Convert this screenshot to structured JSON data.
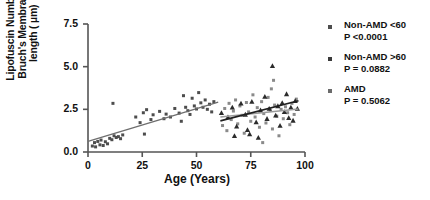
{
  "chart_data": {
    "type": "scatter",
    "title": "",
    "xlabel": "Age (Years)",
    "ylabel_line1": "Lipofuscin Number/",
    "ylabel_line2": "Bruch's Membrane",
    "ylabel_line3": "length ( µm)",
    "xlim": [
      0,
      100
    ],
    "ylim": [
      0.0,
      7.5
    ],
    "xticks": [
      "0",
      "25",
      "50",
      "75",
      "100"
    ],
    "xtick_values": [
      0,
      25,
      50,
      75,
      100
    ],
    "yticks": [
      "0.0",
      "2.5",
      "5.0",
      "7.5"
    ],
    "ytick_values": [
      0.0,
      2.5,
      5.0,
      7.5
    ],
    "grid": false,
    "legend_position": "right",
    "series": [
      {
        "name": "Non-AMD <60",
        "pvalue": "P <0.0001",
        "marker": "square",
        "color": "#4d4d4d",
        "points": [
          [
            2.0,
            0.35
          ],
          [
            3.0,
            0.55
          ],
          [
            3.5,
            0.3
          ],
          [
            4.5,
            0.62
          ],
          [
            5.5,
            0.42
          ],
          [
            6.0,
            0.7
          ],
          [
            7.0,
            0.38
          ],
          [
            8.0,
            0.6
          ],
          [
            9.0,
            0.48
          ],
          [
            10.0,
            0.8
          ],
          [
            11.0,
            0.72
          ],
          [
            12.0,
            0.95
          ],
          [
            13.0,
            0.85
          ],
          [
            14.0,
            0.9
          ],
          [
            15.0,
            0.78
          ],
          [
            16.0,
            1.0
          ],
          [
            11.5,
            2.85
          ],
          [
            22.0,
            2.05
          ],
          [
            24.0,
            1.72
          ],
          [
            25.5,
            2.3
          ],
          [
            26.0,
            1.05
          ],
          [
            27.0,
            2.48
          ],
          [
            29.0,
            1.9
          ],
          [
            30.0,
            2.18
          ],
          [
            33.0,
            2.38
          ],
          [
            35.0,
            1.95
          ],
          [
            36.0,
            2.22
          ],
          [
            38.0,
            2.05
          ],
          [
            40.0,
            2.55
          ],
          [
            42.0,
            2.28
          ],
          [
            43.0,
            1.8
          ],
          [
            44.0,
            3.3
          ],
          [
            45.0,
            2.62
          ],
          [
            46.0,
            2.42
          ],
          [
            47.0,
            2.2
          ],
          [
            48.0,
            3.15
          ],
          [
            49.0,
            2.7
          ],
          [
            50.0,
            2.52
          ],
          [
            51.0,
            3.48
          ],
          [
            52.0,
            2.88
          ],
          [
            53.0,
            2.62
          ],
          [
            54.0,
            3.05
          ],
          [
            55.0,
            2.5
          ],
          [
            56.0,
            2.8
          ],
          [
            57.0,
            2.35
          ],
          [
            58.0,
            2.95
          ]
        ],
        "fit_line": {
          "x0": 0,
          "y0": 0.62,
          "x1": 60,
          "y1": 2.92
        }
      },
      {
        "name": "Non-AMD >60",
        "pvalue": "P = 0.0882",
        "marker": "square",
        "color": "#8a8a8a",
        "points": [
          [
            62.0,
            1.55
          ],
          [
            63.0,
            2.55
          ],
          [
            64.0,
            1.25
          ],
          [
            65.0,
            2.85
          ],
          [
            66.0,
            1.9
          ],
          [
            67.0,
            2.4
          ],
          [
            68.0,
            3.05
          ],
          [
            69.0,
            1.65
          ],
          [
            70.0,
            2.7
          ],
          [
            71.0,
            2.15
          ],
          [
            72.0,
            1.1
          ],
          [
            73.0,
            2.9
          ],
          [
            74.0,
            2.35
          ],
          [
            75.0,
            1.8
          ],
          [
            76.0,
            3.35
          ],
          [
            77.0,
            2.05
          ],
          [
            78.0,
            2.6
          ],
          [
            79.0,
            1.45
          ],
          [
            80.0,
            2.95
          ],
          [
            81.0,
            2.25
          ],
          [
            82.0,
            1.7
          ],
          [
            83.0,
            3.2
          ],
          [
            84.0,
            2.45
          ],
          [
            85.0,
            1.35
          ],
          [
            86.0,
            2.75
          ],
          [
            87.0,
            2.1
          ],
          [
            88.0,
            0.95
          ],
          [
            89.0,
            2.5
          ],
          [
            90.0,
            1.95
          ],
          [
            91.0,
            2.65
          ],
          [
            92.0,
            2.3
          ],
          [
            93.0,
            1.6
          ],
          [
            94.0,
            2.85
          ],
          [
            95.0,
            2.2
          ],
          [
            96.0,
            3.1
          ],
          [
            85.5,
            4.2
          ],
          [
            84.5,
            3.7
          ],
          [
            80.5,
            0.55
          ]
        ],
        "fit_line": {
          "x0": 61,
          "y0": 2.05,
          "x1": 97,
          "y1": 2.52
        }
      },
      {
        "name": "AMD",
        "pvalue": "P =  0.5062",
        "marker": "triangle",
        "color": "#2b2b2b",
        "points": [
          [
            61.5,
            2.3
          ],
          [
            64.5,
            2.05
          ],
          [
            66.5,
            2.62
          ],
          [
            68.5,
            1.5
          ],
          [
            70.5,
            2.85
          ],
          [
            72.5,
            2.2
          ],
          [
            73.5,
            1.3
          ],
          [
            75.5,
            2.95
          ],
          [
            77.5,
            1.75
          ],
          [
            79.5,
            2.45
          ],
          [
            81.5,
            3.25
          ],
          [
            82.5,
            1.95
          ],
          [
            83.5,
            2.55
          ],
          [
            85.0,
            5.05
          ],
          [
            86.5,
            2.15
          ],
          [
            87.5,
            2.7
          ],
          [
            88.5,
            1.55
          ],
          [
            89.5,
            2.88
          ],
          [
            90.5,
            2.35
          ],
          [
            91.5,
            3.4
          ],
          [
            92.5,
            2.0
          ],
          [
            93.5,
            2.62
          ],
          [
            94.5,
            1.85
          ],
          [
            95.5,
            3.0
          ],
          [
            96.5,
            2.55
          ],
          [
            67.5,
            0.95
          ],
          [
            74.5,
            1.05
          ],
          [
            78.5,
            0.85
          ]
        ],
        "fit_line": {
          "x0": 61,
          "y0": 1.82,
          "x1": 97,
          "y1": 3.0
        }
      }
    ]
  },
  "legend": {
    "entries": [
      {
        "label": "Non-AMD <60",
        "pvalue": "P <0.0001"
      },
      {
        "label": "Non-AMD >60",
        "pvalue": "P = 0.0882"
      },
      {
        "label": "AMD",
        "pvalue": "P =  0.5062"
      }
    ]
  },
  "axes": {
    "x_title": "Age (Years)",
    "y_title_line1": "Lipofuscin Number/",
    "y_title_line2": "Bruch's Membrane",
    "y_title_line3": "length ( µm)"
  },
  "colors": {
    "axis": "#555555",
    "text": "#111111",
    "series1": "#4d4d4d",
    "series2": "#8a8a8a",
    "series3": "#2b2b2b",
    "fit1": "#6e6e6e",
    "fit2": "#9a9a9a",
    "fit3": "#1f1f1f"
  }
}
